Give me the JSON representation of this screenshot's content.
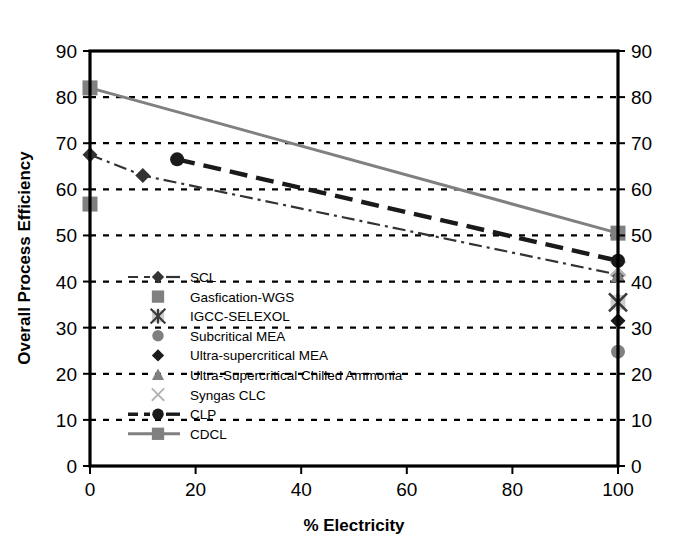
{
  "chart_data": {
    "type": "scatter",
    "title": "",
    "xlabel": "% Electricity",
    "ylabel": "Overall Process Efficiency",
    "xlim": [
      0,
      100
    ],
    "ylim": [
      0,
      90
    ],
    "xticks": [
      0,
      20,
      40,
      60,
      80,
      100
    ],
    "yticks": [
      0,
      10,
      20,
      30,
      40,
      50,
      60,
      70,
      80,
      90
    ],
    "xtick_labels": [
      "0",
      "20",
      "40",
      "60",
      "80",
      "100"
    ],
    "ytick_labels": [
      "0",
      "10",
      "20",
      "30",
      "40",
      "50",
      "60",
      "70",
      "80",
      "90"
    ],
    "right_axis_labels": [
      "0",
      "10",
      "20",
      "30",
      "40",
      "50",
      "60",
      "70",
      "80",
      "90"
    ],
    "grid": "horizontal-dotted",
    "legend_position": "inside-left-lower",
    "colors": {
      "black": "#1a1a1a",
      "dark_gray": "#4d4d4d",
      "gray": "#808080",
      "light_gray": "#a6a6a6",
      "axis": "#000000",
      "grid": "#000000",
      "background": "#ffffff"
    },
    "series": [
      {
        "name": "SCL",
        "marker": "diamond",
        "color": "#333333",
        "line": "dash-dot",
        "line_color": "#333333",
        "points": [
          {
            "x": 0,
            "y": 67.5
          },
          {
            "x": 10,
            "y": 63.0
          },
          {
            "x": 100,
            "y": 41.5
          }
        ]
      },
      {
        "name": "Gasfication-WGS",
        "marker": "square",
        "color": "#808080",
        "line": "none",
        "points": [
          {
            "x": 0,
            "y": 56.8
          }
        ]
      },
      {
        "name": "IGCC-SELEXOL",
        "marker": "star-x",
        "color": "#a6a6a6",
        "line": "none",
        "points": [
          {
            "x": 100,
            "y": 35.5
          }
        ]
      },
      {
        "name": "Subcritical MEA",
        "marker": "circle",
        "color": "#808080",
        "line": "none",
        "points": [
          {
            "x": 100,
            "y": 24.8
          }
        ]
      },
      {
        "name": "Ultra-supercritical MEA",
        "marker": "diamond",
        "color": "#1a1a1a",
        "line": "none",
        "points": [
          {
            "x": 100,
            "y": 31.5
          }
        ]
      },
      {
        "name": "Ultra-Supercritical Chilled Ammonia",
        "marker": "triangle",
        "color": "#808080",
        "line": "none",
        "points": [
          {
            "x": 100,
            "y": 41.2
          }
        ]
      },
      {
        "name": "Syngas CLC",
        "marker": "x",
        "color": "#b3b3b3",
        "line": "none",
        "points": [
          {
            "x": 100,
            "y": 42.8
          }
        ]
      },
      {
        "name": "CLP",
        "marker": "circle",
        "color": "#1a1a1a",
        "line": "dashed-heavy",
        "line_color": "#1a1a1a",
        "points": [
          {
            "x": 16.5,
            "y": 66.5
          },
          {
            "x": 100,
            "y": 44.5
          }
        ]
      },
      {
        "name": "CDCL",
        "marker": "square",
        "color": "#808080",
        "line": "solid",
        "line_color": "#808080",
        "points": [
          {
            "x": 0,
            "y": 82.0
          },
          {
            "x": 100,
            "y": 50.5
          }
        ]
      }
    ],
    "legend": [
      {
        "label": "SCL",
        "marker": "diamond",
        "color": "#333333",
        "line": "dash-dot"
      },
      {
        "label": "Gasfication-WGS",
        "marker": "square",
        "color": "#808080",
        "line": "none"
      },
      {
        "label": "IGCC-SELEXOL",
        "marker": "star-x",
        "color": "#a6a6a6",
        "line": "none"
      },
      {
        "label": "Subcritical MEA",
        "marker": "circle",
        "color": "#808080",
        "line": "none"
      },
      {
        "label": "Ultra-supercritical MEA",
        "marker": "diamond",
        "color": "#1a1a1a",
        "line": "none"
      },
      {
        "label": "Ultra-Supercritical Chilled Ammonia",
        "marker": "triangle",
        "color": "#808080",
        "line": "none"
      },
      {
        "label": "Syngas CLC",
        "marker": "x",
        "color": "#b3b3b3",
        "line": "none"
      },
      {
        "label": "CLP",
        "marker": "circle",
        "color": "#1a1a1a",
        "line": "dashed-heavy"
      },
      {
        "label": "CDCL",
        "marker": "square",
        "color": "#808080",
        "line": "solid"
      }
    ]
  }
}
